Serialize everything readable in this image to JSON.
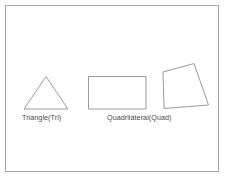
{
  "figure": {
    "background_color": "#ffffff",
    "frame": {
      "name": "outer-border",
      "stroke_color": "#a8a8a8",
      "x": 5.5,
      "y": 5.5,
      "width": 213,
      "height": 166
    },
    "stroke_color": "#9a9a9a",
    "text_color": "#4a4a4a",
    "shapes": [
      {
        "id": "triangle",
        "kind": "polygon",
        "sides": 3,
        "points": "46,76.5 68,109 24,109",
        "label": "Triangle(Tri)",
        "abbreviation": "Tri"
      },
      {
        "id": "rectangle",
        "kind": "polygon",
        "sides": 4,
        "points": "88.5,76.5 146,76.5 146,109 88.5,109",
        "label": "Quadrilateral(Quad)",
        "abbreviation": "Quad"
      },
      {
        "id": "irregular-quadrilateral",
        "kind": "polygon",
        "sides": 4,
        "points": "163,72 194,63.5 208.5,105 164,108.5",
        "label": "",
        "abbreviation": "Quad"
      }
    ],
    "labels": {
      "triangle": "Triangle(Tri)",
      "quadrilateral": "Quadrilateral(Quad)"
    }
  }
}
